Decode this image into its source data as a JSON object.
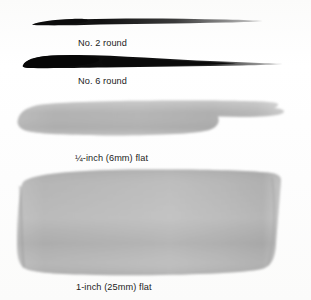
{
  "figure": {
    "background_color": "#fdfdfc",
    "ink_color": "#111111",
    "wash_color": "#b4b4b4"
  },
  "specimens": [
    {
      "id": "no2-round",
      "caption": "No. 2 round",
      "stroke_type": "round-brush-tapered-stroke",
      "ink_color": "#121212"
    },
    {
      "id": "no6-round",
      "caption": "No. 6 round",
      "stroke_type": "round-brush-tapered-stroke",
      "ink_color": "#0d0d0d"
    },
    {
      "id": "quarter-flat",
      "caption": "¼-inch (6mm) flat",
      "stroke_type": "flat-brush-wash-band",
      "ink_color": "#b2b2b2"
    },
    {
      "id": "one-flat",
      "caption": "1-inch (25mm) flat",
      "stroke_type": "flat-brush-wash-block",
      "ink_color": "#b0b0b0"
    }
  ]
}
